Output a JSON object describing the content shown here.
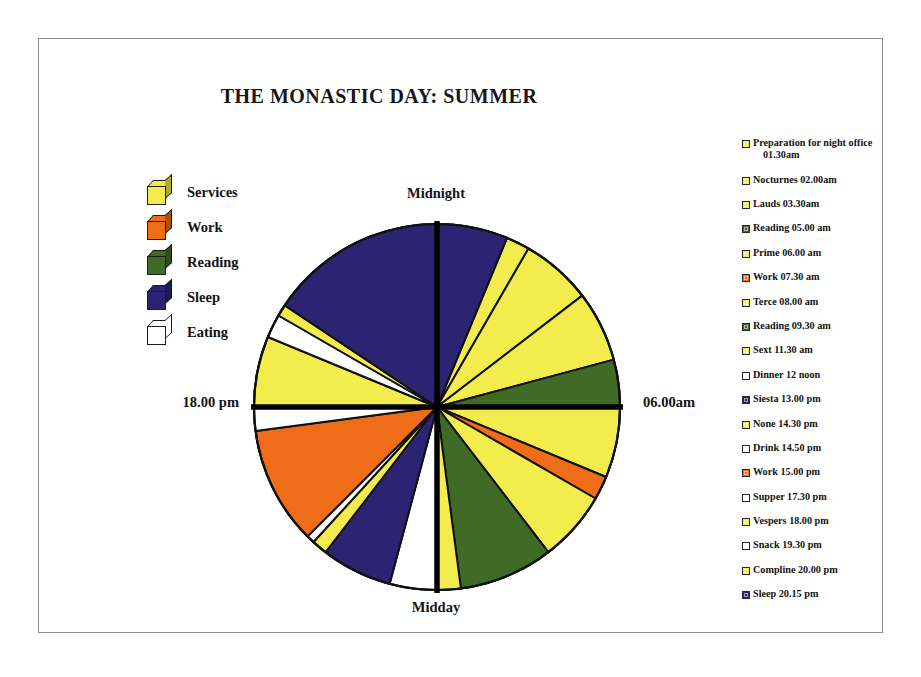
{
  "chart_title": "THE MONASTIC DAY: SUMMER",
  "frame": {
    "border_color": "#8c8c8c"
  },
  "palette": {
    "services": "#f2ec4c",
    "work": "#ef6c18",
    "reading": "#3f6b26",
    "sleep": "#2c2472",
    "eating": "#ffffff",
    "outline": "#111111",
    "axis": "#000000"
  },
  "legend": {
    "items": [
      {
        "label": "Services",
        "color": "#f2ec4c",
        "icon": "cube-icon"
      },
      {
        "label": "Work",
        "color": "#ef6c18",
        "icon": "cube-icon"
      },
      {
        "label": "Reading",
        "color": "#3f6b26",
        "icon": "cube-icon"
      },
      {
        "label": "Sleep",
        "color": "#2c2472",
        "icon": "cube-icon"
      },
      {
        "label": "Eating",
        "color": "#ffffff",
        "icon": "cube-icon"
      }
    ]
  },
  "axis_labels": {
    "top": "Midnight",
    "bottom": "Midday",
    "left": "18.00 pm",
    "right": "06.00am",
    "marker": "diamond-marker"
  },
  "schedule": {
    "items": [
      {
        "label": "Preparation for night office",
        "label_cont": "01.30am",
        "color": "#f2ec4c"
      },
      {
        "label": "Nocturnes 02.00am",
        "color": "#f2ec4c"
      },
      {
        "label": "Lauds 03.30am",
        "color": "#f2ec4c"
      },
      {
        "label": "Reading 05.00 am",
        "color": "#3f6b26"
      },
      {
        "label": "Prime 06.00 am",
        "color": "#f2ec4c"
      },
      {
        "label": "Work 07.30 am",
        "color": "#ef6c18"
      },
      {
        "label": "Terce 08.00 am",
        "color": "#f2ec4c"
      },
      {
        "label": "Reading 09.30 am",
        "color": "#3f6b26"
      },
      {
        "label": "Sext 11.30 am",
        "color": "#f2ec4c"
      },
      {
        "label": "Dinner 12 noon",
        "color": "#ffffff"
      },
      {
        "label": "Siesta 13.00 pm",
        "color": "#2c2472"
      },
      {
        "label": "None 14.30 pm",
        "color": "#f2ec4c"
      },
      {
        "label": "Drink 14.50 pm",
        "color": "#ffffff"
      },
      {
        "label": "Work 15.00 pm",
        "color": "#ef6c18"
      },
      {
        "label": "Supper 17.30 pm",
        "color": "#ffffff"
      },
      {
        "label": "Vespers 18.00 pm",
        "color": "#f2ec4c"
      },
      {
        "label": "Snack 19.30 pm",
        "color": "#ffffff"
      },
      {
        "label": "Compline 20.00 pm",
        "color": "#f2ec4c"
      },
      {
        "label": "Sleep 20.15 pm",
        "color": "#2c2472"
      }
    ]
  },
  "chart_data": {
    "type": "pie",
    "title": "THE MONASTIC DAY: SUMMER",
    "note": "24-hour clock pie: angles are clock positions, midnight at top, midday at bottom, 06.00am at right, 18.00pm at left. Values are durations in hours.",
    "total_hours": 24,
    "axis_ticks": [
      {
        "label": "Midnight",
        "hour": 0,
        "position": "top"
      },
      {
        "label": "06.00am",
        "hour": 6,
        "position": "right"
      },
      {
        "label": "Midday",
        "hour": 12,
        "position": "bottom"
      },
      {
        "label": "18.00 pm",
        "hour": 18,
        "position": "left"
      }
    ],
    "legend_categories": [
      "Services",
      "Work",
      "Reading",
      "Sleep",
      "Eating"
    ],
    "legend_position": "left",
    "slices": [
      {
        "label": "Preparation for night office 01.30am",
        "category": "Services",
        "start_hour": 1.5,
        "end_hour": 2.0,
        "value": 0.5,
        "color": "#f2ec4c"
      },
      {
        "label": "Nocturnes 02.00am",
        "category": "Services",
        "start_hour": 2.0,
        "end_hour": 3.5,
        "value": 1.5,
        "color": "#f2ec4c"
      },
      {
        "label": "Lauds 03.30am",
        "category": "Services",
        "start_hour": 3.5,
        "end_hour": 5.0,
        "value": 1.5,
        "color": "#f2ec4c"
      },
      {
        "label": "Reading 05.00 am",
        "category": "Reading",
        "start_hour": 5.0,
        "end_hour": 6.0,
        "value": 1.0,
        "color": "#3f6b26"
      },
      {
        "label": "Prime 06.00 am",
        "category": "Services",
        "start_hour": 6.0,
        "end_hour": 7.5,
        "value": 1.5,
        "color": "#f2ec4c"
      },
      {
        "label": "Work 07.30 am",
        "category": "Work",
        "start_hour": 7.5,
        "end_hour": 8.0,
        "value": 0.5,
        "color": "#ef6c18"
      },
      {
        "label": "Terce 08.00 am",
        "category": "Services",
        "start_hour": 8.0,
        "end_hour": 9.5,
        "value": 1.5,
        "color": "#f2ec4c"
      },
      {
        "label": "Reading 09.30 am",
        "category": "Reading",
        "start_hour": 9.5,
        "end_hour": 11.5,
        "value": 2.0,
        "color": "#3f6b26"
      },
      {
        "label": "Sext 11.30 am",
        "category": "Services",
        "start_hour": 11.5,
        "end_hour": 12.0,
        "value": 0.5,
        "color": "#f2ec4c"
      },
      {
        "label": "Dinner 12 noon",
        "category": "Eating",
        "start_hour": 12.0,
        "end_hour": 13.0,
        "value": 1.0,
        "color": "#ffffff"
      },
      {
        "label": "Siesta 13.00 pm",
        "category": "Sleep",
        "start_hour": 13.0,
        "end_hour": 14.5,
        "value": 1.5,
        "color": "#2c2472"
      },
      {
        "label": "None 14.30 pm",
        "category": "Services",
        "start_hour": 14.5,
        "end_hour": 14.83,
        "value": 0.33,
        "color": "#f2ec4c"
      },
      {
        "label": "Drink 14.50 pm",
        "category": "Eating",
        "start_hour": 14.83,
        "end_hour": 15.0,
        "value": 0.17,
        "color": "#ffffff"
      },
      {
        "label": "Work 15.00 pm",
        "category": "Work",
        "start_hour": 15.0,
        "end_hour": 17.5,
        "value": 2.5,
        "color": "#ef6c18"
      },
      {
        "label": "Supper 17.30 pm",
        "category": "Eating",
        "start_hour": 17.5,
        "end_hour": 18.0,
        "value": 0.5,
        "color": "#ffffff"
      },
      {
        "label": "Vespers 18.00 pm",
        "category": "Services",
        "start_hour": 18.0,
        "end_hour": 19.5,
        "value": 1.5,
        "color": "#f2ec4c"
      },
      {
        "label": "Snack 19.30 pm",
        "category": "Eating",
        "start_hour": 19.5,
        "end_hour": 20.0,
        "value": 0.5,
        "color": "#ffffff"
      },
      {
        "label": "Compline 20.00 pm",
        "category": "Services",
        "start_hour": 20.0,
        "end_hour": 20.25,
        "value": 0.25,
        "color": "#f2ec4c"
      },
      {
        "label": "Sleep 20.15 pm",
        "category": "Sleep",
        "start_hour": 20.25,
        "end_hour": 25.5,
        "value": 5.25,
        "color": "#2c2472"
      }
    ]
  }
}
